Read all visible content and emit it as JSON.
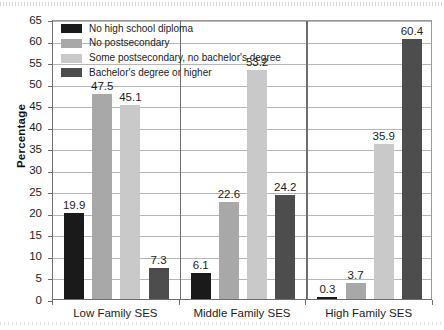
{
  "chart_data": {
    "type": "bar",
    "title": "",
    "xlabel": "",
    "ylabel": "Percentage",
    "ylim": [
      0,
      65
    ],
    "ytick_step": 5,
    "yticks": [
      0,
      5,
      10,
      15,
      20,
      25,
      30,
      35,
      40,
      45,
      50,
      55,
      60,
      65
    ],
    "grid": true,
    "legend_position": "top-left-inside",
    "categories": [
      "Low Family SES",
      "Middle Family SES",
      "High Family SES"
    ],
    "series": [
      {
        "name": "No high school diploma",
        "color": "#1a1a1a",
        "values": [
          19.9,
          6.1,
          0.3
        ]
      },
      {
        "name": "No postsecondary",
        "color": "#a8a8a8",
        "values": [
          47.5,
          22.6,
          3.7
        ]
      },
      {
        "name": "Some postsecondary, no bachelor's degree",
        "color": "#c9c9c9",
        "values": [
          45.1,
          53.2,
          35.9
        ]
      },
      {
        "name": "Bachelor's degree or higher",
        "color": "#4d4d4d",
        "values": [
          7.3,
          24.2,
          60.4
        ]
      }
    ],
    "data_labels": [
      [
        "19.9",
        "47.5",
        "45.1",
        "7.3"
      ],
      [
        "6.1",
        "22.6",
        "53.2",
        "24.2"
      ],
      [
        "0.3",
        "3.7",
        "35.9",
        "60.4"
      ]
    ]
  }
}
